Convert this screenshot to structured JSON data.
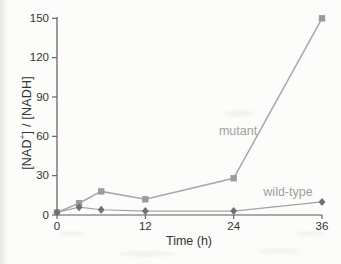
{
  "figure": {
    "background": "#fcfcfa",
    "colors": {
      "axis": "#5a5a5a",
      "tick_text": "#333333",
      "mutant_line": "#a8a8a8",
      "mutant_marker": "#9c9c9c",
      "wildtype_line": "#a2a2a2",
      "wildtype_marker": "#6f6f6f",
      "series_label": "#9f9f9f"
    },
    "labels": {
      "y_axis_pre": "[NAD",
      "y_axis_sup": "+",
      "y_axis_post": "] / [NADH]",
      "x_axis": "Time (h)"
    }
  },
  "chart_data": {
    "type": "line",
    "title": "",
    "xlabel": "Time (h)",
    "ylabel": "[NAD+] / [NADH]",
    "x": [
      0,
      3,
      6,
      12,
      24,
      36
    ],
    "series": [
      {
        "name": "mutant",
        "marker": "square",
        "values": [
          2,
          9,
          18,
          12,
          28,
          150
        ]
      },
      {
        "name": "wild-type",
        "marker": "diamond",
        "values": [
          2,
          6,
          4,
          3,
          3,
          10
        ]
      }
    ],
    "xlim": [
      0,
      36
    ],
    "ylim": [
      0,
      150
    ],
    "x_ticks": [
      0,
      12,
      24,
      36
    ],
    "y_ticks": [
      0,
      30,
      60,
      90,
      120,
      150
    ],
    "grid": false,
    "legend": "inline-annotations",
    "annotations": [
      {
        "text": "mutant",
        "series": "mutant"
      },
      {
        "text": "wild-type",
        "series": "wild-type"
      }
    ]
  }
}
